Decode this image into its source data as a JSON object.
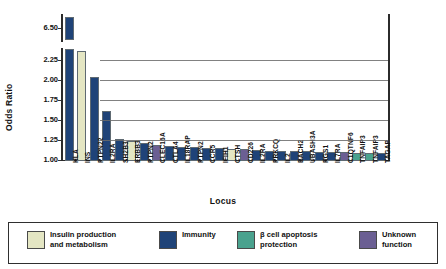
{
  "chart_data": {
    "type": "bar",
    "title": "",
    "xlabel": "Locus",
    "ylabel": "Odds Ratio",
    "ylim": [
      1.0,
      2.4
    ],
    "y_break": true,
    "y_break_top_tick": "6.50",
    "ytick_labels": [
      "6.50",
      "2.25",
      "2.00",
      "1.75",
      "1.50",
      "1.25",
      "1.00"
    ],
    "grid": true,
    "legend_position": "bottom",
    "categories": [
      "HLA",
      "INS",
      "PTPN22",
      "IL2RA",
      "SH2B3",
      "ERBB3",
      "PTPN2",
      "CLEC16A",
      "CTLA4",
      "IL18RAP",
      "PTPN2",
      "CCR5",
      "IFIH1",
      "CTSH",
      "CD226",
      "IL2RA",
      "PRKCQ",
      "IL2",
      "BACH2",
      "UBASH3A",
      "RGS1",
      "IL7RA",
      "C1QTNF6",
      "TNFAIP3",
      "TNFAIP3",
      "TAGAP"
    ],
    "values": [
      6.8,
      2.38,
      2.05,
      1.62,
      1.28,
      1.25,
      1.22,
      1.2,
      1.19,
      1.18,
      1.17,
      1.16,
      1.16,
      1.15,
      1.15,
      1.14,
      1.13,
      1.13,
      1.12,
      1.12,
      1.11,
      1.11,
      1.11,
      1.1,
      1.1,
      1.1
    ],
    "categories_group": [
      "Immunity",
      "Insulin production and metabolism",
      "Immunity",
      "Immunity",
      "Immunity",
      "Insulin production and metabolism",
      "Immunity",
      "Unknown function",
      "Immunity",
      "Immunity",
      "Immunity",
      "Immunity",
      "Immunity",
      "Insulin production and metabolism",
      "Unknown function",
      "Immunity",
      "Immunity",
      "Immunity",
      "Immunity",
      "Immunity",
      "Immunity",
      "Immunity",
      "Unknown function",
      "Beta cell apoptosis protection",
      "Beta cell apoptosis protection",
      "Immunity"
    ]
  },
  "colors": {
    "immunity": "#1f4378",
    "insulin": "#e4e6c3",
    "beta_cell": "#4aa28e",
    "unknown": "#6b5f93",
    "axis": "#2b2b2b",
    "grid": "#6b6b6b",
    "bar_border": "#5f6a72"
  },
  "legend": {
    "items": [
      {
        "label": "Insulin production\nand metabolism",
        "color_key": "insulin"
      },
      {
        "label": "Immunity",
        "color_key": "immunity"
      },
      {
        "label": "β cell apoptosis\nprotection",
        "color_key": "beta_cell"
      },
      {
        "label": "Unknown\nfunction",
        "color_key": "unknown"
      }
    ]
  }
}
